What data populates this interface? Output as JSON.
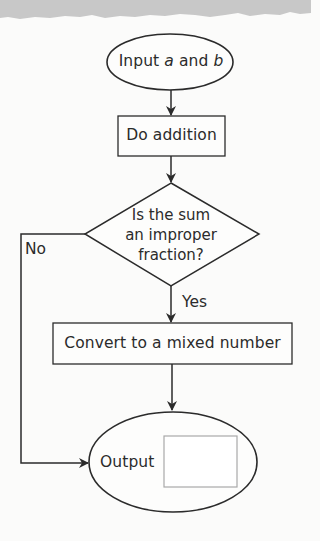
{
  "diagram": {
    "type": "flowchart",
    "nodes": {
      "start": {
        "shape": "ellipse",
        "label_prefix": "Input ",
        "var_a": "a",
        "label_mid": " and ",
        "var_b": "b"
      },
      "add": {
        "shape": "rectangle",
        "label": "Do addition"
      },
      "decision": {
        "shape": "diamond",
        "line1": "Is the sum",
        "line2": "an improper",
        "line3": "fraction?"
      },
      "convert": {
        "shape": "rectangle",
        "label": "Convert to a mixed number"
      },
      "output": {
        "shape": "ellipse",
        "label": "Output",
        "answer_box": ""
      }
    },
    "edges": {
      "yes_label": "Yes",
      "no_label": "No"
    },
    "colors": {
      "stroke": "#2b2b2b",
      "answer_box_stroke": "#a9a9a9",
      "background": "#fbfbfa",
      "torn_edge": "#c9c9c9"
    }
  }
}
